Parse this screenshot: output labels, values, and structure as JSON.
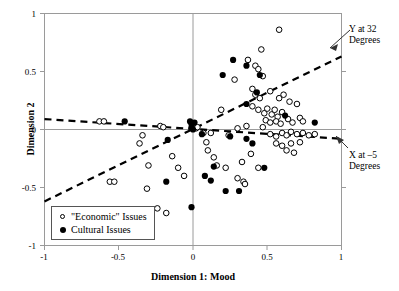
{
  "chart_data": {
    "type": "scatter",
    "title": "",
    "xlabel": "Dimension 1: Mood",
    "ylabel": "Dimension 2",
    "xlim": [
      -1,
      1
    ],
    "ylim": [
      -1,
      1
    ],
    "xticks": [
      "-1",
      "-0.5",
      "0",
      "0.5",
      "1"
    ],
    "xtick_values": [
      -1,
      -0.5,
      0,
      0.5,
      1
    ],
    "yticks": [
      "1",
      "0.5",
      "0",
      "-0.5",
      "-1"
    ],
    "ytick_values": [
      1,
      0.5,
      0,
      -0.5,
      -1
    ],
    "grid": false,
    "legend_position": "lower-left-inside",
    "series": [
      {
        "name": "\"Economic\" Issues",
        "marker": "open-circle",
        "color": "#000000",
        "points": [
          [
            0.58,
            0.86
          ],
          [
            0.46,
            0.69
          ],
          [
            0.28,
            0.43
          ],
          [
            0.19,
            0.17
          ],
          [
            0.37,
            0.6
          ],
          [
            0.42,
            0.55
          ],
          [
            0.44,
            0.52
          ],
          [
            0.47,
            0.46
          ],
          [
            0.4,
            0.35
          ],
          [
            0.42,
            0.3
          ],
          [
            0.45,
            0.27
          ],
          [
            0.52,
            0.33
          ],
          [
            0.58,
            0.27
          ],
          [
            0.61,
            0.3
          ],
          [
            0.65,
            0.24
          ],
          [
            0.7,
            0.22
          ],
          [
            0.4,
            0.2
          ],
          [
            0.44,
            0.17
          ],
          [
            0.48,
            0.14
          ],
          [
            0.5,
            0.18
          ],
          [
            0.53,
            0.13
          ],
          [
            0.55,
            0.17
          ],
          [
            0.57,
            0.11
          ],
          [
            0.6,
            0.15
          ],
          [
            0.49,
            0.08
          ],
          [
            0.52,
            0.06
          ],
          [
            0.56,
            0.07
          ],
          [
            0.59,
            0.05
          ],
          [
            0.64,
            0.09
          ],
          [
            0.67,
            0.06
          ],
          [
            0.72,
            0.1
          ],
          [
            0.74,
            0.07
          ],
          [
            0.47,
            0.02
          ],
          [
            0.36,
            0.03
          ],
          [
            0.3,
            0.01
          ],
          [
            -0.63,
            0.07
          ],
          [
            -0.6,
            0.07
          ],
          [
            -0.22,
            0.03
          ],
          [
            -0.2,
            0.02
          ],
          [
            0.02,
            0.01
          ],
          [
            0.03,
            0.02
          ],
          [
            0.07,
            -0.03
          ],
          [
            0.12,
            -0.03
          ],
          [
            0.24,
            -0.05
          ],
          [
            0.52,
            -0.04
          ],
          [
            0.56,
            -0.06
          ],
          [
            0.6,
            -0.03
          ],
          [
            0.63,
            -0.05
          ],
          [
            0.66,
            -0.02
          ],
          [
            0.7,
            -0.04
          ],
          [
            0.74,
            -0.03
          ],
          [
            0.78,
            -0.05
          ],
          [
            0.82,
            -0.04
          ],
          [
            0.09,
            -0.11
          ],
          [
            0.1,
            -0.18
          ],
          [
            0.14,
            -0.24
          ],
          [
            0.56,
            -0.12
          ],
          [
            0.6,
            -0.14
          ],
          [
            0.63,
            -0.18
          ],
          [
            0.66,
            -0.12
          ],
          [
            0.68,
            -0.2
          ],
          [
            0.72,
            -0.11
          ],
          [
            0.39,
            -0.21
          ],
          [
            0.33,
            -0.28
          ],
          [
            0.22,
            -0.33
          ],
          [
            0.16,
            -0.31
          ],
          [
            0.44,
            -0.33
          ],
          [
            0.3,
            -0.42
          ],
          [
            0.34,
            -0.45
          ],
          [
            0.35,
            -0.47
          ],
          [
            -0.56,
            -0.45
          ],
          [
            -0.53,
            -0.45
          ],
          [
            -0.3,
            -0.31
          ],
          [
            -0.14,
            -0.23
          ],
          [
            -0.1,
            -0.33
          ],
          [
            -0.06,
            -0.4
          ],
          [
            -0.31,
            -0.51
          ],
          [
            -0.24,
            -0.68
          ],
          [
            -0.18,
            -0.72
          ],
          [
            -0.34,
            -0.05
          ],
          [
            -0.36,
            -0.12
          ]
        ]
      },
      {
        "name": "Cultural Issues",
        "marker": "filled-circle",
        "color": "#000000",
        "points": [
          [
            0.45,
            0.47
          ],
          [
            0.43,
            0.32
          ],
          [
            0.36,
            0.22
          ],
          [
            0.27,
            0.6
          ],
          [
            0.36,
            0.55
          ],
          [
            0.2,
            0.47
          ],
          [
            -0.46,
            0.07
          ],
          [
            -0.01,
            0.05
          ],
          [
            -0.01,
            0.02
          ],
          [
            0.0,
            0.0
          ],
          [
            -0.02,
            0.07
          ],
          [
            0.01,
            0.06
          ],
          [
            0.62,
            0.12
          ],
          [
            0.82,
            0.06
          ],
          [
            0.06,
            -0.04
          ],
          [
            0.25,
            -0.06
          ],
          [
            0.4,
            -0.12
          ],
          [
            0.36,
            -0.08
          ],
          [
            -0.17,
            -0.09
          ],
          [
            0.14,
            -0.32
          ],
          [
            0.08,
            -0.4
          ],
          [
            0.12,
            -0.44
          ],
          [
            0.22,
            -0.53
          ],
          [
            0.31,
            -0.53
          ],
          [
            0.48,
            -0.33
          ],
          [
            -0.01,
            -0.67
          ],
          [
            -0.18,
            -0.45
          ]
        ]
      }
    ],
    "trend_lines": [
      {
        "name": "Y at 32 Degrees",
        "style": "dashed",
        "x1": -1.0,
        "y1": -0.62,
        "x2": 1.0,
        "y2": 0.63
      },
      {
        "name": "X at -5 Degrees",
        "style": "dashed",
        "x1": -1.0,
        "y1": 0.09,
        "x2": 1.0,
        "y2": -0.08
      }
    ],
    "annotations": [
      {
        "id": "y32",
        "line1": "Y at 32",
        "line2": "Degrees"
      },
      {
        "id": "x5",
        "line1": "X at –5",
        "line2": "Degrees"
      }
    ]
  }
}
